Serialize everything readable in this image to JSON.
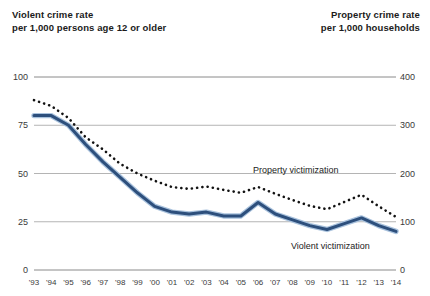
{
  "header": {
    "left_line1": "Violent crime rate",
    "left_line2": "per 1,000 persons age 12 or older",
    "right_line1": "Property crime rate",
    "right_line2": "per 1,000 households"
  },
  "chart_data": {
    "type": "line",
    "title": "",
    "xlabel": "",
    "grid": true,
    "legend_position": "inline-annotation",
    "x": [
      "'93",
      "'94",
      "'95",
      "'96",
      "'97",
      "'98",
      "'99",
      "'00",
      "'01",
      "'02",
      "'03",
      "'04",
      "'05",
      "'06",
      "'07",
      "'08",
      "'09",
      "'10",
      "'11",
      "'12",
      "'13",
      "'14"
    ],
    "left_axis": {
      "label": "Violent crime rate per 1,000 persons age 12 or older",
      "ticks": [
        "0",
        "25",
        "50",
        "75",
        "100"
      ],
      "tick_values": [
        0,
        25,
        50,
        75,
        100
      ],
      "ylim": [
        0,
        100
      ]
    },
    "right_axis": {
      "label": "Property crime rate per 1,000 households",
      "ticks": [
        "0",
        "100",
        "200",
        "300",
        "400"
      ],
      "tick_values": [
        0,
        100,
        200,
        300,
        400
      ],
      "ylim": [
        0,
        400
      ]
    },
    "series": [
      {
        "name": "Violent victimization",
        "annotation": "Violent victimization",
        "axis": "left",
        "style": "solid",
        "color": "#2d4f7c",
        "values": [
          80,
          80,
          75,
          65,
          56,
          48,
          40,
          33,
          30,
          29,
          30,
          28,
          28,
          35,
          29,
          26,
          23,
          21,
          24,
          27,
          23,
          20
        ]
      },
      {
        "name": "Property victimization",
        "annotation": "Property victimization",
        "axis": "right",
        "style": "dotted",
        "color": "#121212",
        "values": [
          352,
          340,
          315,
          275,
          250,
          220,
          200,
          185,
          172,
          168,
          173,
          166,
          160,
          172,
          158,
          145,
          133,
          126,
          141,
          156,
          132,
          110
        ]
      }
    ]
  }
}
